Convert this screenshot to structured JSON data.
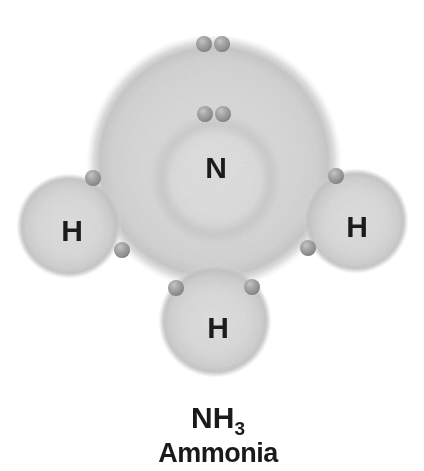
{
  "atoms": {
    "nitrogen": "N",
    "hydrogen_left": "H",
    "hydrogen_right": "H",
    "hydrogen_bottom": "H"
  },
  "caption": {
    "formula_base": "NH",
    "formula_subscript": "3",
    "name": "Ammonia"
  },
  "electrons": {
    "total_shown": 10,
    "lone_pair_on_nitrogen_top": 2,
    "core_pair_inside_inner_ring": 2,
    "bonding_pairs": 3,
    "bonding_electrons": 6
  },
  "colors": {
    "background": "#ffffff",
    "shell_fill": "#d7d7d7",
    "shell_rim": "#c6c6c6",
    "inner_ring": "#c2c2c2",
    "electron_body": "#9a9a9a",
    "electron_rim": "#6d6d6d",
    "text": "#1c1c1c"
  }
}
